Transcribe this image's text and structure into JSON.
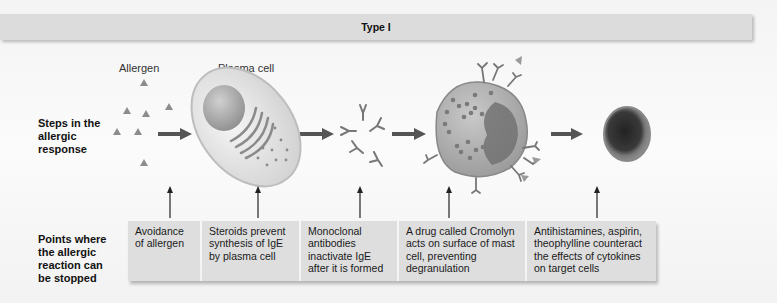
{
  "header": {
    "title": "Type I"
  },
  "row_labels": {
    "steps": "Steps in the allergic response",
    "points": "Points where the allergic reaction can be stopped"
  },
  "steps": [
    {
      "label": "Allergen",
      "icon": "allergen-triangles-icon"
    },
    {
      "label": "Plasma cell",
      "icon": "plasma-cell-icon"
    },
    {
      "label": "",
      "icon": "ige-antibodies-icon"
    },
    {
      "label": "",
      "icon": "mast-cell-icon"
    },
    {
      "label": "",
      "icon": "target-cell-icon"
    }
  ],
  "interventions": [
    {
      "text": "Avoidance of allergen"
    },
    {
      "text": "Steroids prevent synthesis of IgE by plasma cell"
    },
    {
      "text": "Monoclonal antibodies inactivate IgE after it is formed"
    },
    {
      "text": "A drug called Cromolyn acts on surface of mast cell, preventing degranulation"
    },
    {
      "text": "Antihistamines, aspirin, theophylline counteract the effects of cytokines on target cells"
    }
  ],
  "colors": {
    "header_bg": "#dcdcdc",
    "box_bg": "#dedede",
    "arrow": "#555555",
    "cell_gray": "#8a8a8a"
  }
}
